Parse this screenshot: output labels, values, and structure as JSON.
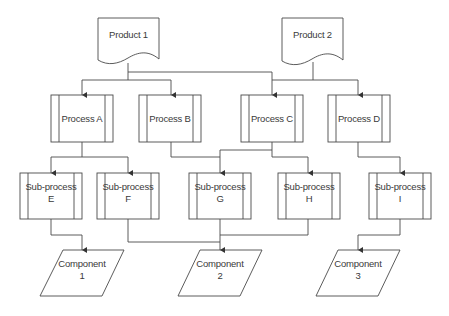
{
  "diagram": {
    "type": "flowchart",
    "products": [
      {
        "id": "product-1",
        "label": "Product 1"
      },
      {
        "id": "product-2",
        "label": "Product 2"
      }
    ],
    "processes": [
      {
        "id": "process-a",
        "label": "Process A"
      },
      {
        "id": "process-b",
        "label": "Process B"
      },
      {
        "id": "process-c",
        "label": "Process C"
      },
      {
        "id": "process-d",
        "label": "Process D"
      }
    ],
    "subprocesses": [
      {
        "id": "subprocess-e",
        "label": "Sub-process\nE"
      },
      {
        "id": "subprocess-f",
        "label": "Sub-process\nF"
      },
      {
        "id": "subprocess-g",
        "label": "Sub-process\nG"
      },
      {
        "id": "subprocess-h",
        "label": "Sub-process\nH"
      },
      {
        "id": "subprocess-i",
        "label": "Sub-process\nI"
      }
    ],
    "components": [
      {
        "id": "component-1",
        "label": "Component\n1"
      },
      {
        "id": "component-2",
        "label": "Component\n2"
      },
      {
        "id": "component-3",
        "label": "Component\n3"
      }
    ],
    "edges": [
      [
        "Product 1",
        "Process A"
      ],
      [
        "Product 1",
        "Process B"
      ],
      [
        "Product 1",
        "Process C"
      ],
      [
        "Product 2",
        "Process C"
      ],
      [
        "Product 2",
        "Process D"
      ],
      [
        "Process A",
        "Sub-process E"
      ],
      [
        "Process A",
        "Sub-process F"
      ],
      [
        "Process B",
        "Sub-process G"
      ],
      [
        "Process C",
        "Sub-process G"
      ],
      [
        "Process C",
        "Sub-process H"
      ],
      [
        "Process D",
        "Sub-process I"
      ],
      [
        "Sub-process E",
        "Component 1"
      ],
      [
        "Sub-process F",
        "Component 2"
      ],
      [
        "Sub-process G",
        "Component 2"
      ],
      [
        "Sub-process H",
        "Component 2"
      ],
      [
        "Sub-process I",
        "Component 3"
      ]
    ]
  },
  "colors": {
    "stroke": "#4a4a4a",
    "text": "#3a3a3a",
    "background": "#ffffff"
  }
}
